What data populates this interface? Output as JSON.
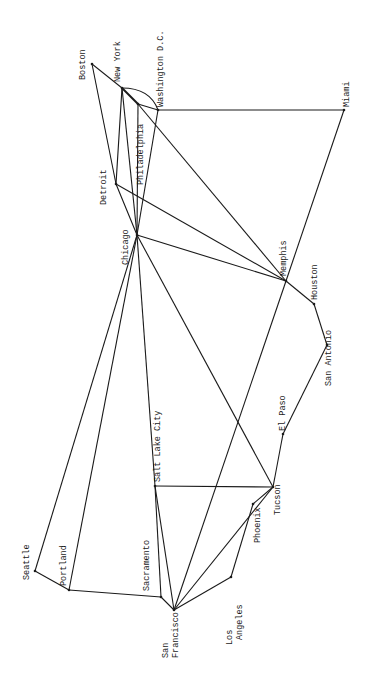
{
  "diagram": {
    "type": "network-graph",
    "orientation": "rotated 90deg clockwise (west at bottom, east at top)",
    "nodes": [
      {
        "id": "boston",
        "label": "Boston",
        "x": 92,
        "y": 64,
        "lx": 85,
        "ly": 80
      },
      {
        "id": "newyork",
        "label": "New York",
        "x": 122,
        "y": 88,
        "lx": 120,
        "ly": 82
      },
      {
        "id": "philadelphia",
        "label": "Philadelphia",
        "x": 138,
        "y": 104,
        "lx": 143,
        "ly": 185
      },
      {
        "id": "washington",
        "label": "Washington D.C.",
        "x": 158,
        "y": 110,
        "lx": 163,
        "ly": 107
      },
      {
        "id": "miami",
        "label": "Miami",
        "x": 344,
        "y": 110,
        "lx": 349,
        "ly": 107
      },
      {
        "id": "detroit",
        "label": "Detroit",
        "x": 116,
        "y": 184,
        "lx": 106,
        "ly": 205
      },
      {
        "id": "chicago",
        "label": "Chicago",
        "x": 137,
        "y": 235,
        "lx": 128,
        "ly": 265
      },
      {
        "id": "memphis",
        "label": "Memphis",
        "x": 286,
        "y": 281,
        "lx": 286,
        "ly": 276
      },
      {
        "id": "houston",
        "label": "Houston",
        "x": 314,
        "y": 304,
        "lx": 317,
        "ly": 300
      },
      {
        "id": "sanantonio",
        "label": "San Antonio",
        "x": 327,
        "y": 345,
        "lx": 331,
        "ly": 386
      },
      {
        "id": "elpaso",
        "label": "El Paso",
        "x": 283,
        "y": 434,
        "lx": 285,
        "ly": 431
      },
      {
        "id": "tucson",
        "label": "Tucson",
        "x": 273,
        "y": 487,
        "lx": 280,
        "ly": 515
      },
      {
        "id": "saltlakecity",
        "label": "Salt Lake City",
        "x": 155,
        "y": 486,
        "lx": 160,
        "ly": 482
      },
      {
        "id": "phoenix",
        "label": "Phoenix",
        "x": 253,
        "y": 504,
        "lx": 260,
        "ly": 543
      },
      {
        "id": "losangeles",
        "label": "Los Angeles",
        "x": 231,
        "y": 577,
        "lx": 232,
        "ly": 645,
        "lx2": 242,
        "ly2": 640,
        "label1": "Los",
        "label2": "Angeles"
      },
      {
        "id": "seattle",
        "label": "Seattle",
        "x": 35,
        "y": 571,
        "lx": 29,
        "ly": 580
      },
      {
        "id": "portland",
        "label": "Portland",
        "x": 69,
        "y": 590,
        "lx": 66,
        "ly": 586
      },
      {
        "id": "sacramento",
        "label": "Sacramento",
        "x": 161,
        "y": 597,
        "lx": 149,
        "ly": 591
      },
      {
        "id": "sanfrancisco",
        "label": "San Francisco",
        "x": 174,
        "y": 610,
        "lx": 168,
        "ly": 658,
        "lx2": 178,
        "ly2": 658,
        "label1": "San",
        "label2": "Francisco"
      }
    ],
    "edges": [
      [
        "boston",
        "newyork"
      ],
      [
        "boston",
        "detroit"
      ],
      [
        "newyork",
        "philadelphia"
      ],
      [
        "philadelphia",
        "washington"
      ],
      [
        "newyork",
        "detroit"
      ],
      [
        "newyork",
        "chicago"
      ],
      [
        "philadelphia",
        "chicago"
      ],
      [
        "washington",
        "chicago"
      ],
      [
        "washington",
        "miami"
      ],
      [
        "philadelphia",
        "memphis"
      ],
      [
        "detroit",
        "chicago"
      ],
      [
        "detroit",
        "memphis"
      ],
      [
        "chicago",
        "memphis"
      ],
      [
        "chicago",
        "seattle"
      ],
      [
        "chicago",
        "portland"
      ],
      [
        "chicago",
        "saltlakecity"
      ],
      [
        "chicago",
        "tucson"
      ],
      [
        "miami",
        "memphis"
      ],
      [
        "memphis",
        "sanfrancisco"
      ],
      [
        "memphis",
        "houston"
      ],
      [
        "houston",
        "sanantonio"
      ],
      [
        "sanantonio",
        "elpaso"
      ],
      [
        "elpaso",
        "tucson"
      ],
      [
        "saltlakecity",
        "tucson"
      ],
      [
        "saltlakecity",
        "sacramento"
      ],
      [
        "saltlakecity",
        "sanfrancisco"
      ],
      [
        "tucson",
        "phoenix"
      ],
      [
        "tucson",
        "sanfrancisco"
      ],
      [
        "phoenix",
        "losangeles"
      ],
      [
        "losangeles",
        "sanfrancisco"
      ],
      [
        "seattle",
        "portland"
      ],
      [
        "portland",
        "sacramento"
      ],
      [
        "sacramento",
        "sanfrancisco"
      ]
    ],
    "curved_edges": [
      {
        "from": "newyork",
        "to": "washington",
        "cx": 150,
        "cy": 88
      }
    ]
  }
}
